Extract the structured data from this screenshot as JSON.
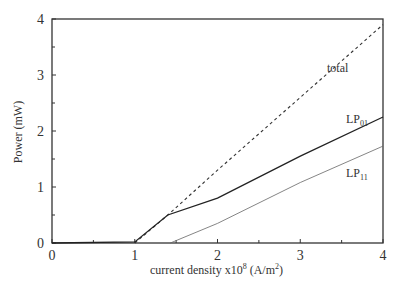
{
  "chart_data": {
    "type": "line",
    "title": "",
    "xlabel": "current density x10^8 (A/m^2)",
    "xlabel_parts": {
      "main": "current density x10",
      "exp": "8",
      "unit_open": " (A/m",
      "unit_exp": "2",
      "unit_close": ")"
    },
    "ylabel": "Power (mW)",
    "xlim": [
      0,
      4
    ],
    "ylim": [
      0,
      4
    ],
    "x_ticks": [
      0,
      1,
      2,
      3,
      4
    ],
    "y_ticks": [
      0,
      1,
      2,
      3,
      4
    ],
    "grid": false,
    "legend": "inline labels",
    "series": [
      {
        "name": "total",
        "label": "total",
        "style": "dashed",
        "points": [
          [
            1.0,
            0.0
          ],
          [
            1.4,
            0.5
          ],
          [
            2.0,
            1.3
          ],
          [
            3.0,
            2.6
          ],
          [
            4.0,
            3.9
          ]
        ]
      },
      {
        "name": "LP01",
        "label": "LP",
        "label_sub": "01",
        "style": "solid",
        "points": [
          [
            0.0,
            0.0
          ],
          [
            1.0,
            0.02
          ],
          [
            1.4,
            0.5
          ],
          [
            2.0,
            0.8
          ],
          [
            3.0,
            1.55
          ],
          [
            4.0,
            2.25
          ]
        ]
      },
      {
        "name": "LP11",
        "label": "LP",
        "label_sub": "11",
        "style": "thin-solid",
        "points": [
          [
            1.43,
            0.0
          ],
          [
            2.0,
            0.35
          ],
          [
            3.0,
            1.08
          ],
          [
            4.0,
            1.73
          ]
        ]
      }
    ]
  }
}
